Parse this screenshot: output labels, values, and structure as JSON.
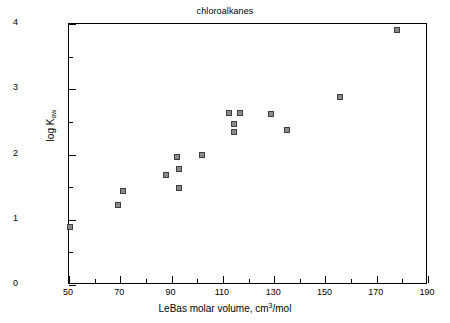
{
  "chart_data": {
    "type": "scatter",
    "title": "chloroalkanes",
    "xlabel_prefix": "LeBas molar volume, cm",
    "xlabel_sup": "3",
    "xlabel_suffix": "/mol",
    "ylabel_prefix": "log K",
    "ylabel_sub": "ow",
    "xlim": [
      50,
      190
    ],
    "ylim": [
      0,
      4
    ],
    "x_major_ticks": [
      50,
      70,
      90,
      110,
      130,
      150,
      170,
      190
    ],
    "x_minor_ticks": [
      60,
      80,
      100,
      120,
      140,
      160,
      180
    ],
    "y_major_ticks": [
      0,
      1,
      2,
      3,
      4
    ],
    "y_minor_ticks": [
      0.5,
      1.5,
      2.5,
      3.5
    ],
    "x_tick_labels": [
      "50",
      "70",
      "90",
      "110",
      "130",
      "150",
      "170",
      "190"
    ],
    "y_tick_labels": [
      "0",
      "1",
      "2",
      "3",
      "4"
    ],
    "grid": false,
    "legend": "none",
    "marker": "square",
    "marker_fill": "#8a8a8a",
    "marker_edge": "#3d3d3d",
    "points": [
      {
        "x": 50.4,
        "y": 0.89
      },
      {
        "x": 69.3,
        "y": 1.23
      },
      {
        "x": 70.9,
        "y": 1.44
      },
      {
        "x": 87.8,
        "y": 1.69
      },
      {
        "x": 92.0,
        "y": 1.96
      },
      {
        "x": 92.8,
        "y": 1.78
      },
      {
        "x": 93.0,
        "y": 1.48
      },
      {
        "x": 102.0,
        "y": 1.99
      },
      {
        "x": 112.4,
        "y": 2.63
      },
      {
        "x": 116.5,
        "y": 2.63
      },
      {
        "x": 114.3,
        "y": 2.46
      },
      {
        "x": 114.3,
        "y": 2.34
      },
      {
        "x": 128.7,
        "y": 2.62
      },
      {
        "x": 135.0,
        "y": 2.38
      },
      {
        "x": 155.8,
        "y": 2.88
      },
      {
        "x": 177.9,
        "y": 3.91
      }
    ]
  }
}
